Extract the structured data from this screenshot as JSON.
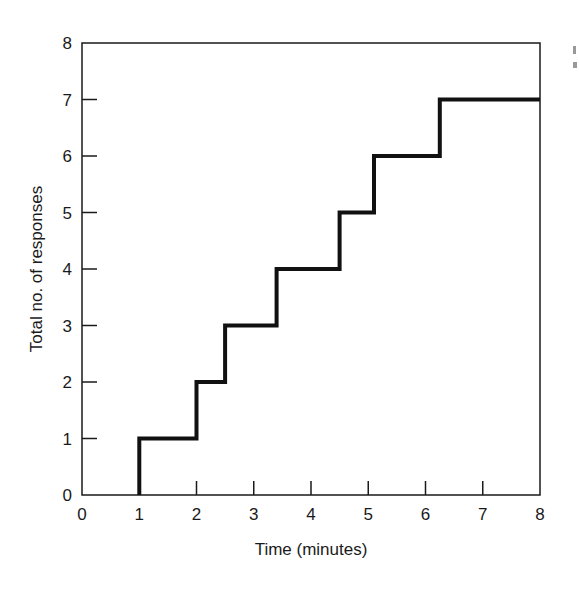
{
  "chart_data": {
    "type": "line",
    "subtype": "step",
    "title": "",
    "xlabel": "Time (minutes)",
    "ylabel": "Total no. of responses",
    "xlim": [
      0,
      8
    ],
    "ylim": [
      0,
      8
    ],
    "x_ticks": [
      0,
      1,
      2,
      3,
      4,
      5,
      6,
      7,
      8
    ],
    "y_ticks": [
      0,
      1,
      2,
      3,
      4,
      5,
      6,
      7,
      8
    ],
    "grid": false,
    "legend": null,
    "series": [
      {
        "name": "Cumulative responses",
        "color": "#111111",
        "step_times": [
          1.0,
          2.0,
          2.5,
          3.4,
          4.5,
          5.1,
          6.25
        ],
        "x": [
          1.0,
          1.0,
          2.0,
          2.0,
          2.5,
          2.5,
          3.4,
          3.4,
          4.5,
          4.5,
          5.1,
          5.1,
          6.25,
          6.25,
          8.0
        ],
        "y": [
          0,
          1,
          1,
          2,
          2,
          3,
          3,
          4,
          4,
          5,
          5,
          6,
          6,
          7,
          7
        ]
      }
    ]
  },
  "axes": {
    "x_title": "Time (minutes)",
    "y_title": "Total no. of responses",
    "x_tick_labels": [
      "0",
      "1",
      "2",
      "3",
      "4",
      "5",
      "6",
      "7",
      "8"
    ],
    "y_tick_labels": [
      "0",
      "1",
      "2",
      "3",
      "4",
      "5",
      "6",
      "7",
      "8"
    ]
  }
}
